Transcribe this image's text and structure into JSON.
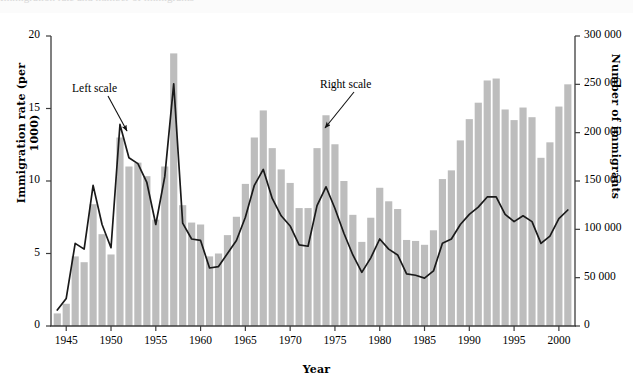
{
  "figure": {
    "top_artifact_text": "Immigration rate and number of immigrants",
    "background_color": "#ffffff",
    "bar_color": "#bdbdbd",
    "line_color": "#1a1a1a",
    "axis_color": "#3c3c3c"
  },
  "axes": {
    "x": {
      "label": "Year",
      "ticks": [
        "1945",
        "1950",
        "1955",
        "1960",
        "1965",
        "1970",
        "1975",
        "1980",
        "1985",
        "1990",
        "1995",
        "2000"
      ],
      "tick_values": [
        1945,
        1950,
        1955,
        1960,
        1965,
        1970,
        1975,
        1980,
        1985,
        1990,
        1995,
        2000
      ],
      "range": [
        1943.3,
        2001.8
      ]
    },
    "y_left": {
      "label": "Immigration rate (per 1000)",
      "ticks": [
        "0",
        "5",
        "10",
        "15",
        "20"
      ],
      "tick_values": [
        0,
        5,
        10,
        15,
        20
      ],
      "range": [
        0,
        20
      ]
    },
    "y_right": {
      "label": "Number of immigrants",
      "ticks": [
        "0",
        "50 000",
        "100 000",
        "150 000",
        "200 000",
        "250 000",
        "300 000"
      ],
      "tick_values": [
        0,
        50000,
        100000,
        150000,
        200000,
        250000,
        300000
      ],
      "range": [
        0,
        300000
      ]
    }
  },
  "annotations": [
    {
      "name": "left-scale",
      "text": "Left scale",
      "x_px": 72,
      "y_px": 82,
      "arrow": {
        "x1": 108,
        "y1": 96,
        "x2": 127,
        "y2": 131
      }
    },
    {
      "name": "right-scale",
      "text": "Right scale",
      "x_px": 320,
      "y_px": 78,
      "arrow": {
        "x1": 354,
        "y1": 92,
        "x2": 325,
        "y2": 128
      }
    }
  ],
  "chart_data": {
    "type": "bar",
    "title": "",
    "subtitle": "",
    "xlabel": "Year",
    "ylabel": "Immigration rate (per 1000)",
    "ylabel_right": "Number of immigrants",
    "xlim": [
      1943.3,
      2001.8
    ],
    "ylim": [
      0,
      20
    ],
    "ylim_right": [
      0,
      300000
    ],
    "grid": false,
    "legend": "inline annotations (Left scale / Right scale)",
    "x": [
      1944,
      1945,
      1946,
      1947,
      1948,
      1949,
      1950,
      1951,
      1952,
      1953,
      1954,
      1955,
      1956,
      1957,
      1958,
      1959,
      1960,
      1961,
      1962,
      1963,
      1964,
      1965,
      1966,
      1967,
      1968,
      1969,
      1970,
      1971,
      1972,
      1973,
      1974,
      1975,
      1976,
      1977,
      1978,
      1979,
      1980,
      1981,
      1982,
      1983,
      1984,
      1985,
      1986,
      1987,
      1988,
      1989,
      1990,
      1991,
      1992,
      1993,
      1994,
      1995,
      1996,
      1997,
      1998,
      1999,
      2000,
      2001
    ],
    "series": [
      {
        "name": "Number of immigrants",
        "axis": "right",
        "type": "bar",
        "color": "#bdbdbd",
        "values": [
          13000,
          23000,
          72000,
          66000,
          126000,
          95000,
          74000,
          195000,
          165000,
          169000,
          155000,
          110000,
          165000,
          282000,
          125000,
          107000,
          105000,
          72000,
          75000,
          94000,
          113000,
          147000,
          195000,
          223000,
          184000,
          162000,
          148000,
          122000,
          122000,
          184000,
          218000,
          188000,
          150000,
          115000,
          87000,
          112000,
          143000,
          129000,
          121000,
          89000,
          88000,
          84000,
          99000,
          152000,
          161000,
          192000,
          214000,
          231000,
          254000,
          256000,
          224000,
          213000,
          226000,
          216000,
          174000,
          190000,
          227000,
          250000
        ]
      },
      {
        "name": "Immigration rate (per 1000)",
        "axis": "left",
        "type": "line",
        "color": "#1a1a1a",
        "values": [
          1.1,
          1.9,
          5.7,
          5.3,
          9.7,
          7.0,
          5.4,
          13.9,
          11.6,
          11.2,
          9.9,
          7.0,
          10.3,
          16.7,
          7.1,
          6.0,
          5.9,
          4.0,
          4.1,
          5.0,
          5.9,
          7.5,
          9.7,
          10.8,
          8.8,
          7.6,
          6.9,
          5.6,
          5.5,
          8.3,
          9.6,
          8.1,
          6.4,
          4.9,
          3.7,
          4.7,
          6.0,
          5.3,
          4.9,
          3.6,
          3.5,
          3.3,
          3.8,
          5.7,
          6.0,
          7.0,
          7.7,
          8.2,
          8.9,
          8.9,
          7.7,
          7.2,
          7.6,
          7.2,
          5.7,
          6.2,
          7.4,
          8.0
        ]
      }
    ]
  }
}
